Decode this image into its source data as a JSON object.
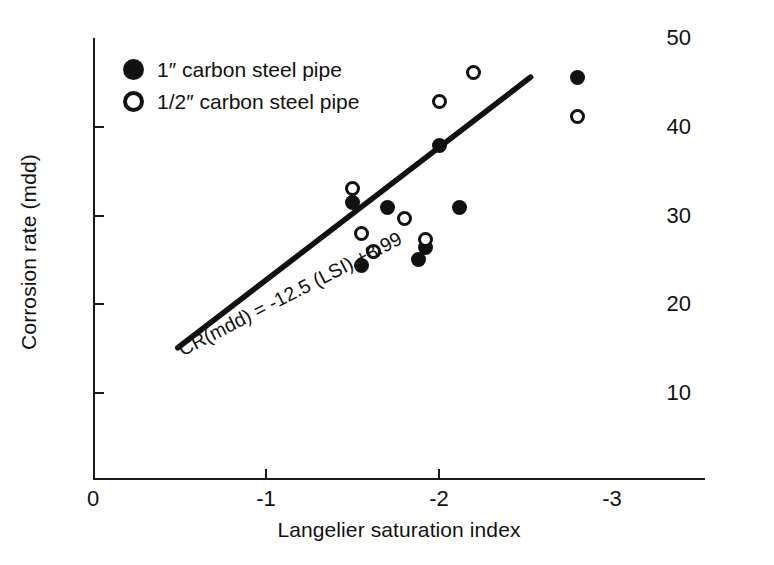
{
  "chart_data": {
    "type": "scatter",
    "title": "",
    "xlabel": "Langelier saturation index",
    "ylabel": "Corrosion rate (mdd)",
    "xlim": [
      0,
      -3
    ],
    "ylim": [
      0,
      50
    ],
    "x_ticks": [
      "0",
      "-1",
      "-2",
      "-3"
    ],
    "x_tick_values": [
      0,
      -1,
      -2,
      -3
    ],
    "y_ticks": [
      "10",
      "20",
      "30",
      "40",
      "50"
    ],
    "y_tick_values": [
      10,
      20,
      30,
      40,
      50
    ],
    "grid": false,
    "legend_position": "top-left",
    "series": [
      {
        "name": "1″ carbon steel pipe",
        "marker": "filled-circle",
        "color": "#111111",
        "points": [
          {
            "x": -1.5,
            "y": 31.5
          },
          {
            "x": -1.55,
            "y": 24.4
          },
          {
            "x": -1.7,
            "y": 30.9
          },
          {
            "x": -1.88,
            "y": 25.0
          },
          {
            "x": -1.92,
            "y": 26.4
          },
          {
            "x": -2.0,
            "y": 37.9
          },
          {
            "x": -2.12,
            "y": 30.9
          },
          {
            "x": -2.8,
            "y": 45.5
          }
        ]
      },
      {
        "name": "1/2″ carbon steel pipe",
        "marker": "open-circle",
        "color": "#111111",
        "points": [
          {
            "x": -1.5,
            "y": 33.0
          },
          {
            "x": -1.55,
            "y": 28.0
          },
          {
            "x": -1.62,
            "y": 26.0
          },
          {
            "x": -1.8,
            "y": 29.7
          },
          {
            "x": -1.92,
            "y": 27.3
          },
          {
            "x": -2.0,
            "y": 42.9
          },
          {
            "x": -2.2,
            "y": 46.1
          },
          {
            "x": -2.8,
            "y": 41.1
          }
        ]
      }
    ],
    "trend_line": {
      "equation": "CR(mdd) = -12.5 (LSI) +8.99",
      "slope": -12.5,
      "intercept": 8.99,
      "x_start": -0.49,
      "y_start": 15.1,
      "x_end": -2.53,
      "y_end": 45.6
    },
    "annotations": [
      {
        "name": "regression-equation",
        "text": "CR(mdd) = -12.5 (LSI) +8.99"
      }
    ]
  },
  "legend": {
    "items": [
      {
        "label": "1″ carbon steel pipe",
        "marker": "filled-circle"
      },
      {
        "label": "1/2″ carbon steel pipe",
        "marker": "open-circle"
      }
    ]
  }
}
